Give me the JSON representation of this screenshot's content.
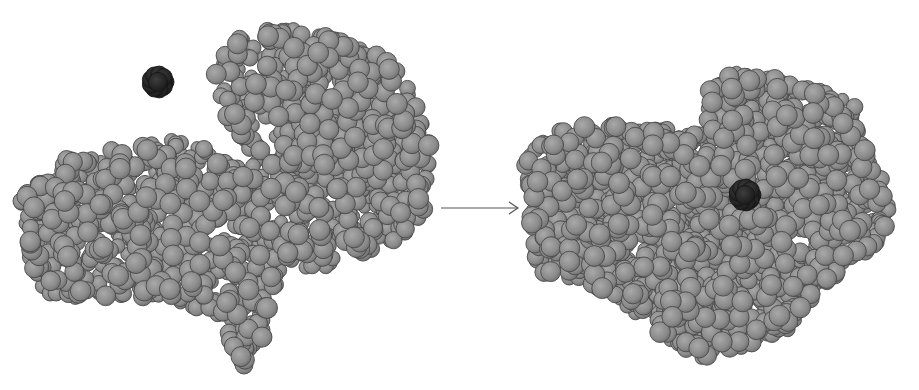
{
  "figure": {
    "caption_visible_text": "",
    "colors": {
      "background": "#ffffff",
      "atom_fill": "#8c8c8c",
      "atom_highlight": "#a8a8a8",
      "atom_outline": "#4a4a4a",
      "ligand_fill": "#2a2a2a",
      "ligand_outline": "#151515",
      "arrow": "#555555"
    },
    "panels": [
      {
        "name": "before-binding",
        "enzyme_outline": [
          [
            20,
            200
          ],
          [
            45,
            165
          ],
          [
            100,
            150
          ],
          [
            175,
            140
          ],
          [
            195,
            130
          ],
          [
            215,
            160
          ],
          [
            250,
            165
          ],
          [
            250,
            150
          ],
          [
            225,
            115
          ],
          [
            215,
            70
          ],
          [
            225,
            45
          ],
          [
            260,
            28
          ],
          [
            300,
            30
          ],
          [
            340,
            40
          ],
          [
            380,
            55
          ],
          [
            400,
            65
          ],
          [
            410,
            95
          ],
          [
            430,
            130
          ],
          [
            430,
            170
          ],
          [
            425,
            210
          ],
          [
            400,
            240
          ],
          [
            345,
            260
          ],
          [
            300,
            275
          ],
          [
            270,
            290
          ],
          [
            265,
            340
          ],
          [
            245,
            368
          ],
          [
            228,
            340
          ],
          [
            225,
            320
          ],
          [
            170,
            300
          ],
          [
            130,
            295
          ],
          [
            100,
            300
          ],
          [
            45,
            300
          ],
          [
            30,
            260
          ],
          [
            25,
            230
          ]
        ],
        "ligand": {
          "cx": 158,
          "cy": 82,
          "r": 16,
          "label": "substrate"
        }
      },
      {
        "name": "after-binding",
        "enzyme_outline": [
          [
            525,
            160
          ],
          [
            555,
            130
          ],
          [
            605,
            125
          ],
          [
            650,
            125
          ],
          [
            705,
            135
          ],
          [
            710,
            90
          ],
          [
            725,
            70
          ],
          [
            760,
            75
          ],
          [
            800,
            85
          ],
          [
            840,
            95
          ],
          [
            860,
            110
          ],
          [
            865,
            150
          ],
          [
            880,
            175
          ],
          [
            890,
            210
          ],
          [
            880,
            245
          ],
          [
            845,
            265
          ],
          [
            810,
            300
          ],
          [
            790,
            330
          ],
          [
            750,
            345
          ],
          [
            700,
            360
          ],
          [
            700,
            390
          ],
          [
            700,
            360
          ],
          [
            695,
            355
          ],
          [
            650,
            330
          ],
          [
            620,
            300
          ],
          [
            580,
            280
          ],
          [
            540,
            275
          ],
          [
            530,
            240
          ],
          [
            530,
            200
          ]
        ],
        "ligand": {
          "cx": 745,
          "cy": 195,
          "r": 16,
          "label": "substrate-bound"
        }
      }
    ],
    "arrow": {
      "x1": 441,
      "y1": 208,
      "x2": 518,
      "y2": 208
    }
  }
}
